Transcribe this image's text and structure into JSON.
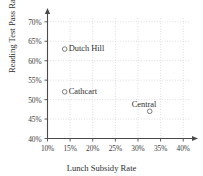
{
  "chart_data": {
    "type": "scatter",
    "title": "",
    "xlabel": "Lunch Subsidy Rate",
    "ylabel": "Reading Test Pass Rate",
    "xlim": [
      10,
      41.5
    ],
    "ylim": [
      40,
      71.5
    ],
    "xticks": [
      "10%",
      "15%",
      "20%",
      "25%",
      "30%",
      "35%",
      "40%"
    ],
    "xtick_values": [
      10,
      15,
      20,
      25,
      30,
      35,
      40
    ],
    "yticks": [
      "40%",
      "45%",
      "50%",
      "55%",
      "60%",
      "65%",
      "70%"
    ],
    "ytick_values": [
      40,
      45,
      50,
      55,
      60,
      65,
      70
    ],
    "grid": true,
    "legend": "none",
    "marker_style": "open-circle",
    "points": [
      {
        "label": "Dutch Hill",
        "x": 13.8,
        "y": 63.0
      },
      {
        "label": "Cathcart",
        "x": 13.8,
        "y": 52.0
      },
      {
        "label": "Central",
        "x": 32.6,
        "y": 47.0
      }
    ],
    "colors": {
      "axis": "#4a4a4a",
      "grid": "#c9c9c9",
      "marker": "#6e6e6e",
      "text": "#2f2f2f",
      "background": "#ffffff"
    }
  }
}
